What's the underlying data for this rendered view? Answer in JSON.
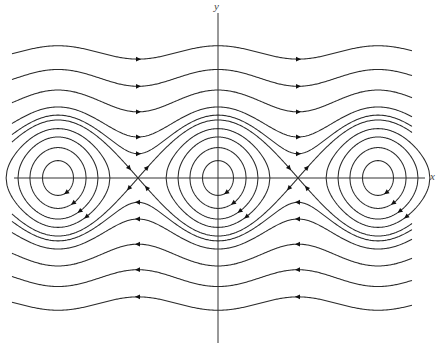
{
  "figure": {
    "type": "phase_portrait",
    "axes": {
      "x_label": "x",
      "y_label": "y"
    },
    "colors": {
      "curve": "#2a2a2a",
      "axis": "#333333",
      "arrow": "#111111",
      "background": "#ffffff"
    },
    "equilibria": {
      "centers_px": [
        58,
        218,
        380
      ],
      "saddles_px": [
        137,
        300
      ]
    },
    "flow_direction": {
      "upper_rotations": "rightward",
      "lower_rotations": "leftward",
      "closed_orbits": "clockwise"
    }
  },
  "chart_data": {
    "type": "phase_portrait",
    "title": "",
    "xlabel": "x",
    "ylabel": "y",
    "system": "x' = y, y' = -sin(x)",
    "energy_function": "H = y^2/2 - cos(x)",
    "centers": [
      -6.283,
      0,
      6.283
    ],
    "saddles": [
      -3.1416,
      3.1416
    ],
    "closed_orbit_levels_H": [
      -0.82,
      -0.45,
      0.0,
      0.45
    ],
    "separatrix_level_H": 1.0,
    "rotation_orbit_levels_H": [
      1.35,
      2.0,
      3.6,
      6.0,
      9.4
    ],
    "grid": false,
    "legend": null
  }
}
